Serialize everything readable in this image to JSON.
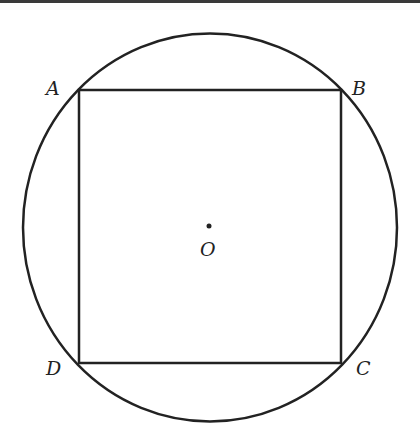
{
  "diagram": {
    "labels": {
      "A": "A",
      "B": "B",
      "C": "C",
      "D": "D",
      "O": "O"
    },
    "colors": {
      "stroke": "#222222",
      "background": "#ffffff",
      "topbar": "#3a3a3a"
    }
  }
}
